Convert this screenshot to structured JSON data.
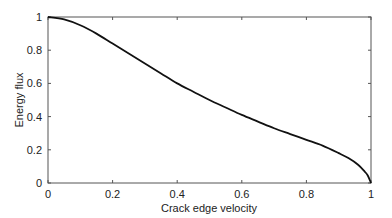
{
  "chart_data": {
    "type": "line",
    "title": "",
    "xlabel": "Crack edge velocity",
    "ylabel": "Energy flux",
    "xlim": [
      0,
      1
    ],
    "ylim": [
      0,
      1
    ],
    "xticks": [
      "0",
      "0.2",
      "0.4",
      "0.6",
      "0.8",
      "1"
    ],
    "yticks": [
      "0",
      "0.2",
      "0.4",
      "0.6",
      "0.8",
      "1"
    ],
    "grid": false,
    "legend": null,
    "series": [
      {
        "name": "Energy flux",
        "color": "#111111",
        "x": [
          0,
          0.05,
          0.1,
          0.15,
          0.2,
          0.25,
          0.3,
          0.35,
          0.4,
          0.45,
          0.5,
          0.55,
          0.6,
          0.65,
          0.7,
          0.75,
          0.8,
          0.85,
          0.9,
          0.93,
          0.96,
          0.98,
          0.99,
          1.0
        ],
        "y": [
          1.0,
          0.985,
          0.95,
          0.9,
          0.84,
          0.78,
          0.72,
          0.66,
          0.6,
          0.55,
          0.5,
          0.455,
          0.41,
          0.37,
          0.33,
          0.295,
          0.26,
          0.225,
          0.18,
          0.15,
          0.11,
          0.07,
          0.045,
          0.0
        ]
      }
    ]
  }
}
